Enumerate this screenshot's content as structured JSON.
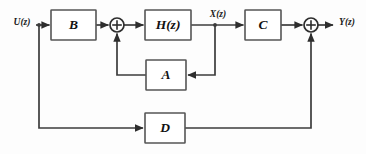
{
  "diagram": {
    "type": "control-system-block-diagram",
    "colors": {
      "background": "#fdfdfd",
      "block_fill": "#ffffff",
      "block_stroke": "#555555",
      "wire": "#3c3c3c",
      "label": "#111111"
    },
    "blocks": [
      {
        "id": "B",
        "label": "B",
        "x": 51,
        "y": 10,
        "w": 45,
        "h": 30
      },
      {
        "id": "H",
        "label": "H(z)",
        "x": 145,
        "y": 10,
        "w": 46,
        "h": 30
      },
      {
        "id": "C",
        "label": "C",
        "x": 245,
        "y": 10,
        "w": 36,
        "h": 30
      },
      {
        "id": "A",
        "label": "A",
        "x": 146,
        "y": 60,
        "w": 40,
        "h": 30
      },
      {
        "id": "D",
        "label": "D",
        "x": 145,
        "y": 113,
        "w": 40,
        "h": 30
      }
    ],
    "summing_junctions": [
      {
        "id": "sum-input",
        "cx": 117,
        "cy": 25,
        "r": 7,
        "symbol": "+"
      },
      {
        "id": "sum-output",
        "cx": 311,
        "cy": 25,
        "r": 7,
        "symbol": "+"
      }
    ],
    "signals": [
      {
        "id": "input",
        "label": "U(z)",
        "base": "U",
        "var": "z",
        "x": 22,
        "y": 23
      },
      {
        "id": "state",
        "label": "X(z)",
        "base": "X",
        "var": "z",
        "x": 218,
        "y": 15
      },
      {
        "id": "output",
        "label": "Y(z)",
        "base": "Y",
        "var": "z",
        "x": 347,
        "y": 23
      }
    ],
    "connections": [
      "U(z) -> B",
      "U(z) -> D (feedforward branch)",
      "B -> sum-input",
      "sum-input -> H(z)",
      "H(z) -> X(z) -> C",
      "X(z) -> A (feedback branch)",
      "A -> sum-input",
      "C -> sum-output",
      "D -> sum-output",
      "sum-output -> Y(z)"
    ]
  }
}
